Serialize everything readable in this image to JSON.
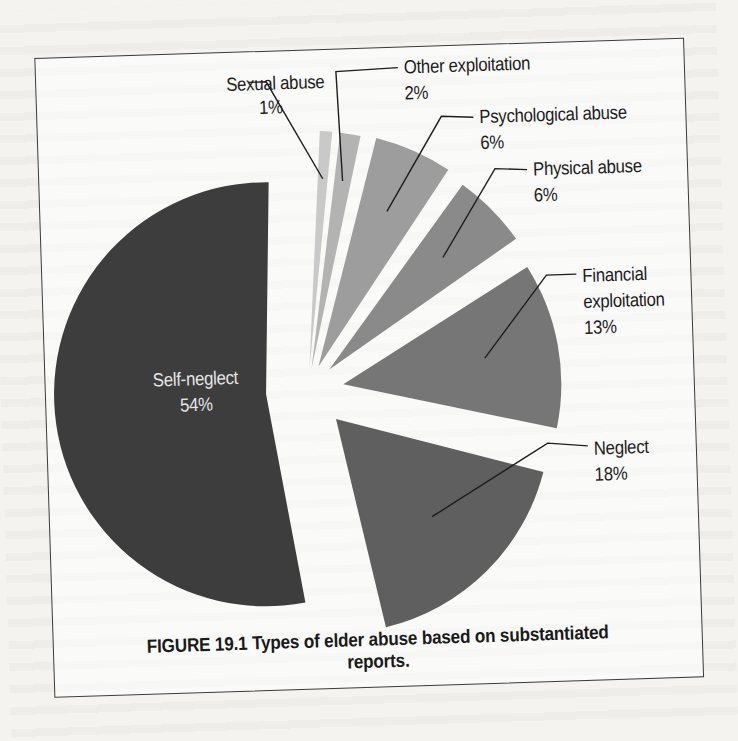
{
  "figure": {
    "caption_line1": "FIGURE 19.1 Types of elder abuse based on substantiated",
    "caption_line2": "reports."
  },
  "chart_data": {
    "type": "pie",
    "title": "FIGURE 19.1 Types of elder abuse based on substantiated reports.",
    "exploded": true,
    "categories": [
      "Sexual abuse",
      "Other exploitation",
      "Psychological abuse",
      "Physical abuse",
      "Financial exploitation",
      "Neglect",
      "Self-neglect"
    ],
    "values": [
      1,
      2,
      6,
      6,
      13,
      18,
      54
    ],
    "unit": "%",
    "colors": [
      "#c9c9c9",
      "#b3b3b3",
      "#9d9d9d",
      "#8a8a8a",
      "#767676",
      "#5f5f5f",
      "#3d3d3d"
    ],
    "legend": "none (callout labels)",
    "labels": [
      {
        "name": "Sexual abuse",
        "pct": "1%"
      },
      {
        "name": "Other exploitation",
        "pct": "2%"
      },
      {
        "name": "Psychological abuse",
        "pct": "6%"
      },
      {
        "name": "Physical abuse",
        "pct": "6%"
      },
      {
        "name": "Financial exploitation",
        "name_line1": "Financial",
        "name_line2": "exploitation",
        "pct": "13%"
      },
      {
        "name": "Neglect",
        "pct": "18%"
      },
      {
        "name": "Self-neglect",
        "pct": "54%"
      }
    ]
  }
}
